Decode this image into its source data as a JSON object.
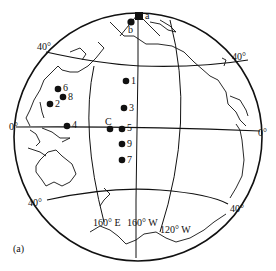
{
  "figure": {
    "caption": "(a)",
    "projection": "orthographic globe centered on Pacific",
    "colors": {
      "ink": "#111111",
      "background": "#ffffff"
    }
  },
  "graticule_labels": {
    "lat_40N_left": "40°",
    "lat_40N_right": "40°",
    "lat_0_left": "0°",
    "lat_0_right": "0°",
    "lat_40S_left": "40°",
    "lat_40S_right": "40°",
    "lon_160E": "160° E",
    "lon_160W": "160° W",
    "lon_120W": "120° W"
  },
  "sample_points": [
    {
      "id": "a",
      "label": "a",
      "x": 139,
      "y": 16,
      "shape": "square"
    },
    {
      "id": "b",
      "label": "b",
      "x": 131,
      "y": 21,
      "shape": "circle"
    },
    {
      "id": "1",
      "label": "1",
      "x": 126,
      "y": 81,
      "shape": "circle"
    },
    {
      "id": "3",
      "label": "3",
      "x": 124,
      "y": 108,
      "shape": "circle"
    },
    {
      "id": "C",
      "label": "C",
      "x": 110,
      "y": 129,
      "shape": "circle"
    },
    {
      "id": "5",
      "label": "5",
      "x": 122,
      "y": 129,
      "shape": "circle"
    },
    {
      "id": "9",
      "label": "9",
      "x": 122,
      "y": 144,
      "shape": "circle"
    },
    {
      "id": "7",
      "label": "7",
      "x": 122,
      "y": 160,
      "shape": "circle"
    },
    {
      "id": "6",
      "label": "6",
      "x": 58,
      "y": 89,
      "shape": "circle"
    },
    {
      "id": "8",
      "label": "8",
      "x": 63,
      "y": 97,
      "shape": "circle"
    },
    {
      "id": "2",
      "label": "2",
      "x": 50,
      "y": 104,
      "shape": "circle"
    },
    {
      "id": "4",
      "label": "4",
      "x": 67,
      "y": 126,
      "shape": "circle"
    }
  ],
  "point_labels": {
    "a": "a",
    "b": "b",
    "p1": "1",
    "p3": "3",
    "pC": "C",
    "p5": "5",
    "p9": "9",
    "p7": "7",
    "p6": "6",
    "p8": "8",
    "p2": "2",
    "p4": "4"
  }
}
